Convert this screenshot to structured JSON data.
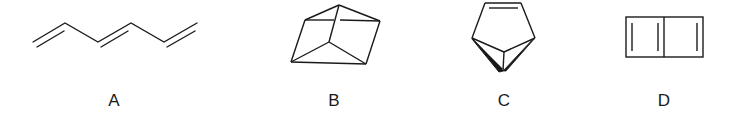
{
  "figure": {
    "type": "chemical-structures",
    "stroke_color": "#1a1a1a",
    "structures": [
      {
        "label": "A",
        "description": "1,3,5-hexatriene (zigzag chain with three double bonds)",
        "label_x": 114
      },
      {
        "label": "B",
        "description": "prismane-like polycyclic cage",
        "label_x": 334
      },
      {
        "label": "C",
        "description": "bicyclic structure with cyclopentene and fused cyclopropane (wedge bonds)",
        "label_x": 504
      },
      {
        "label": "D",
        "description": "bicyclobutadiene-like fused four-membered rings with three double bonds",
        "label_x": 664
      }
    ]
  }
}
